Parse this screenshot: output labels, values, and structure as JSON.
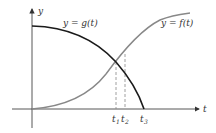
{
  "diagram": {
    "axes": {
      "x_label": "t",
      "y_label": "y"
    },
    "curves": [
      {
        "name": "g",
        "label": "y = g(t)",
        "color": "#1a1a1a",
        "description": "decreasing concave-down curve from y-axis to t3"
      },
      {
        "name": "f",
        "label": "y = f(t)",
        "color": "#888888",
        "description": "increasing S-shaped curve from origin"
      }
    ],
    "ticks": [
      {
        "label": "t",
        "sub": "1"
      },
      {
        "label": "t",
        "sub": "2"
      },
      {
        "label": "t",
        "sub": "3"
      }
    ],
    "colors": {
      "axis": "#333333",
      "dashed": "#888888",
      "g_curve": "#1a1a1a",
      "f_curve": "#888888"
    }
  }
}
